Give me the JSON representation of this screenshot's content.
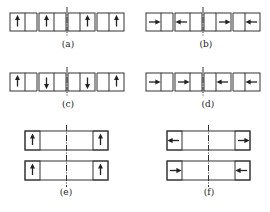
{
  "figure": {
    "panels": [
      {
        "id": "a",
        "label": "(a)",
        "layout": "four-cell",
        "arrows": [
          "up",
          "up",
          "up",
          "up"
        ]
      },
      {
        "id": "b",
        "label": "(b)",
        "layout": "four-cell",
        "arrows": [
          "right",
          "left",
          "right",
          "left"
        ]
      },
      {
        "id": "c",
        "label": "(c)",
        "layout": "four-cell",
        "arrows": [
          "up",
          "down",
          "down",
          "up"
        ]
      },
      {
        "id": "d",
        "label": "(d)",
        "layout": "four-cell",
        "arrows": [
          "right",
          "right",
          "left",
          "left"
        ]
      },
      {
        "id": "e",
        "label": "(e)",
        "layout": "two-bar",
        "arrows": [
          [
            "up",
            "up"
          ],
          [
            "up",
            "up"
          ]
        ]
      },
      {
        "id": "f",
        "label": "(f)",
        "layout": "two-bar",
        "arrows": [
          [
            "left",
            "right"
          ],
          [
            "right",
            "left"
          ]
        ]
      }
    ]
  },
  "colors": {
    "stroke": "#333333",
    "background": "#ffffff"
  }
}
